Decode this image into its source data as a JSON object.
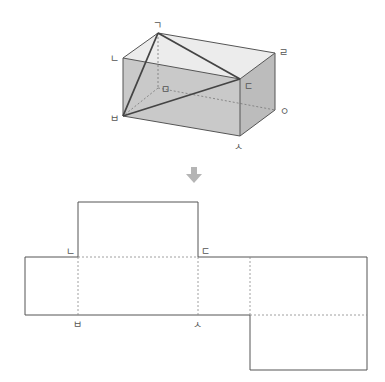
{
  "figure": {
    "type": "cuboid-and-net",
    "colors": {
      "top_face": "#ececec",
      "front_face": "#c9c9c9",
      "side_face": "#bcbcbc",
      "edge": "#555555",
      "diagonal": "#444444",
      "hidden": "#777777",
      "arrow": "#b5b5b5",
      "net_line": "#555555",
      "net_fold": "#888888"
    }
  },
  "cuboid": {
    "vertex_labels": {
      "g": "ㄱ",
      "n": "ㄴ",
      "d": "ㄷ",
      "r": "ㄹ",
      "m": "ㅁ",
      "b": "ㅂ",
      "s": "ㅅ",
      "o": "ㅇ"
    },
    "triangle": [
      "ㄱ",
      "ㅂ",
      "ㄷ"
    ]
  },
  "arrow": {
    "direction": "down",
    "icon": "down-arrow-icon"
  },
  "net": {
    "vertex_labels": {
      "n": "ㄴ",
      "d": "ㄷ",
      "b": "ㅂ",
      "s": "ㅅ"
    }
  }
}
